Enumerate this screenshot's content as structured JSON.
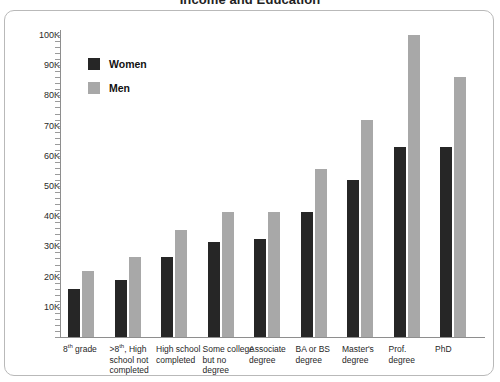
{
  "chart_data": {
    "type": "bar",
    "title": "Income and Education",
    "xlabel": "",
    "ylabel": "",
    "ylim": [
      0,
      100000
    ],
    "y_tick_labels": [
      "100K",
      "90K",
      "80K",
      "70K",
      "60K",
      "50K",
      "40K",
      "30K",
      "20K",
      "10K"
    ],
    "y_tick_values": [
      100000,
      90000,
      80000,
      70000,
      60000,
      50000,
      40000,
      30000,
      20000,
      10000
    ],
    "grid": false,
    "legend_position": "upper-left-inside",
    "categories": [
      "8th grade",
      ">8th, High school not completed",
      "High school completed",
      "Some college but no degree",
      "Associate degree",
      "BA or BS degree",
      "Master's degree",
      "Prof. degree",
      "PhD"
    ],
    "series": [
      {
        "name": "Women",
        "color": "#262626",
        "values": [
          16000,
          19000,
          26500,
          31500,
          32500,
          41500,
          52000,
          63000,
          63000
        ]
      },
      {
        "name": "Men",
        "color": "#a8a8a8",
        "values": [
          22000,
          26500,
          35500,
          41500,
          41500,
          55500,
          72000,
          100000,
          86000
        ]
      }
    ]
  },
  "axis": {
    "y_labels": [
      {
        "text": "100K",
        "value": 100000
      },
      {
        "text": "90K",
        "value": 90000
      },
      {
        "text": "80K",
        "value": 80000
      },
      {
        "text": "70K",
        "value": 70000
      },
      {
        "text": "60K",
        "value": 60000
      },
      {
        "text": "50K",
        "value": 50000
      },
      {
        "text": "40K",
        "value": 40000
      },
      {
        "text": "30K",
        "value": 30000
      },
      {
        "text": "20K",
        "value": 20000
      },
      {
        "text": "10K",
        "value": 10000
      }
    ]
  },
  "category_labels": [
    {
      "pre": "8",
      "sup": "th",
      "post": " grade"
    },
    {
      "pre": ">8",
      "sup": "th",
      "post": ", High school not completed"
    },
    {
      "pre": "",
      "sup": "",
      "post": "High school completed"
    },
    {
      "pre": "",
      "sup": "",
      "post": "Some college but no degree"
    },
    {
      "pre": "",
      "sup": "",
      "post": "Associate degree"
    },
    {
      "pre": "",
      "sup": "",
      "post": "BA or BS degree"
    },
    {
      "pre": "",
      "sup": "",
      "post": "Master's degree"
    },
    {
      "pre": "",
      "sup": "",
      "post": "Prof. degree"
    },
    {
      "pre": "",
      "sup": "",
      "post": "PhD"
    }
  ],
  "legend": {
    "items": [
      {
        "label": "Women",
        "color": "#262626"
      },
      {
        "label": "Men",
        "color": "#a8a8a8"
      }
    ]
  },
  "colors": {
    "women": "#262626",
    "men": "#a8a8a8",
    "axis": "#8e8e8e",
    "frame": "#b9b9b9",
    "background": "#ffffff"
  }
}
